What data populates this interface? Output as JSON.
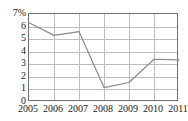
{
  "chart_data": {
    "type": "line",
    "title": "",
    "subtitle": "",
    "xlabel": "",
    "ylabel": "",
    "categories": [
      "2005",
      "2006",
      "2007",
      "2008",
      "2009",
      "2010",
      "2011"
    ],
    "x": [
      2005,
      2006,
      2007,
      2008,
      2009,
      2010,
      2011
    ],
    "values": [
      6.3,
      5.3,
      5.6,
      1.15,
      1.55,
      3.4,
      3.35
    ],
    "series": [
      {
        "name": "",
        "values": [
          6.3,
          5.3,
          5.6,
          1.15,
          1.55,
          3.4,
          3.35
        ]
      }
    ],
    "ylim": [
      0,
      7
    ],
    "xlim": [
      2005,
      2011
    ],
    "y_ticks": [
      0,
      1,
      2,
      3,
      4,
      5,
      6,
      7
    ],
    "y_tick_labels": [
      "0",
      "1",
      "2",
      "3",
      "4",
      "5",
      "6",
      "7%"
    ],
    "x_ticks": [
      2005,
      2006,
      2007,
      2008,
      2009,
      2010,
      2011
    ],
    "x_tick_labels": [
      "2005",
      "2006",
      "2007",
      "2008",
      "2009",
      "2010",
      "2011"
    ],
    "grid": true,
    "grid_axis": "both",
    "legend": false,
    "legend_position": "none",
    "unit": "%",
    "annotations": []
  },
  "style": {
    "line_color": "#8a8a8a",
    "grid_color": "#bdbdbd",
    "axis_color": "#6e6e6e",
    "text_color": "#1a1a1a",
    "background": "#ffffff"
  }
}
